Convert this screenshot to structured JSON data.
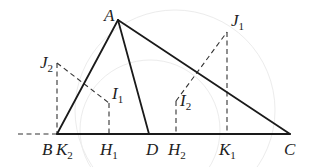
{
  "diagram": {
    "type": "geometry",
    "points": {
      "A": {
        "label": "A",
        "sub": "",
        "x": 118,
        "y": 20
      },
      "B": {
        "label": "B",
        "sub": "",
        "x": 57,
        "y": 134
      },
      "K2": {
        "label": "K",
        "sub": "2",
        "x": 57,
        "y": 134
      },
      "H1": {
        "label": "H",
        "sub": "1",
        "x": 109,
        "y": 134
      },
      "D": {
        "label": "D",
        "sub": "",
        "x": 149,
        "y": 134
      },
      "H2": {
        "label": "H",
        "sub": "2",
        "x": 176,
        "y": 134
      },
      "K1": {
        "label": "K",
        "sub": "1",
        "x": 227,
        "y": 134
      },
      "C": {
        "label": "C",
        "sub": "",
        "x": 290,
        "y": 134
      },
      "I1": {
        "label": "I",
        "sub": "1",
        "x": 109,
        "y": 103
      },
      "I2": {
        "label": "I",
        "sub": "2",
        "x": 176,
        "y": 101
      },
      "J1": {
        "label": "J",
        "sub": "1",
        "x": 227,
        "y": 32
      },
      "J2": {
        "label": "J",
        "sub": "2",
        "x": 57,
        "y": 63
      }
    },
    "solid_segments": [
      [
        "A",
        "B"
      ],
      [
        "A",
        "D"
      ],
      [
        "A",
        "C"
      ],
      [
        "B",
        "C"
      ]
    ],
    "dashed_segments": [
      [
        "ext",
        "B"
      ],
      [
        "J2",
        "K2"
      ],
      [
        "J2",
        "I1"
      ],
      [
        "I1",
        "H1"
      ],
      [
        "I2",
        "H2"
      ],
      [
        "I2",
        "J1"
      ],
      [
        "J1",
        "K1"
      ]
    ],
    "extension_start": {
      "x": 18,
      "y": 134
    }
  },
  "labels": {
    "A": {
      "main": "A",
      "sub": ""
    },
    "J1": {
      "main": "J",
      "sub": "1"
    },
    "J2": {
      "main": "J",
      "sub": "2"
    },
    "I1": {
      "main": "I",
      "sub": "1"
    },
    "I2": {
      "main": "I",
      "sub": "2"
    },
    "B": {
      "main": "B",
      "sub": ""
    },
    "K2": {
      "main": "K",
      "sub": "2"
    },
    "H1": {
      "main": "H",
      "sub": "1"
    },
    "D": {
      "main": "D",
      "sub": ""
    },
    "H2": {
      "main": "H",
      "sub": "2"
    },
    "K1": {
      "main": "K",
      "sub": "1"
    },
    "C": {
      "main": "C",
      "sub": ""
    }
  }
}
